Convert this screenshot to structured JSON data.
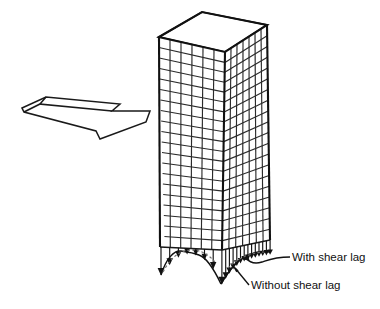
{
  "figure": {
    "type": "technical-line-diagram",
    "background_color": "#ffffff",
    "line_color": "#1a1a1a"
  },
  "building": {
    "name": "framed-tube-tower",
    "floors": 20,
    "bays_left_face": 6,
    "bays_right_face": 7,
    "roof_shape": "parallelogram",
    "description": "Isometric outline of a rectangular high-rise tower with an exterior column-and-spandrel grid on both visible faces"
  },
  "load_arrow": {
    "name": "lateral-load-arrow",
    "direction": "right",
    "style": "3d-block-outline",
    "meaning": "lateral wind load applied to the tower face"
  },
  "stress_diagram": {
    "name": "base-stress-distribution",
    "arrow_count_left": 8,
    "arrow_count_right": 13,
    "arrow_direction": "downward",
    "baseline_note": "axial stress in exterior columns at base"
  },
  "labels": {
    "with_shear_lag": "With shear lag",
    "without_shear_lag": "Without shear lag"
  },
  "colors": {
    "stroke": "#1a1a1a",
    "grid": "#2b2b2b",
    "dashed_curve": "#6e6e6e",
    "text": "#111111"
  }
}
